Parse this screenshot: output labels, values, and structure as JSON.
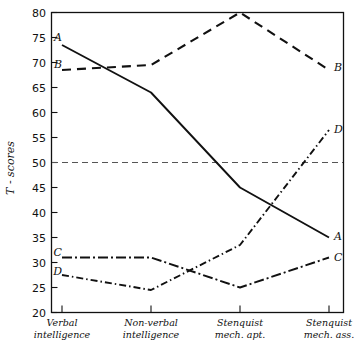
{
  "chart_data": {
    "type": "line",
    "title": "",
    "xlabel": "",
    "ylabel": "T - scores",
    "ylim": [
      20,
      80
    ],
    "xlim": [
      0,
      3
    ],
    "grid": false,
    "legend": "inline-end-labels",
    "categories": [
      "Verbal intelligence",
      "Non-verbal intelligence",
      "Stenquist mech. apt.",
      "Stenquist mech. ass."
    ],
    "category_lines": [
      [
        "Verbal",
        "intelligence"
      ],
      [
        "Non-verbal",
        "intelligence"
      ],
      [
        "Stenquist",
        "mech. apt."
      ],
      [
        "Stenquist",
        "mech. ass."
      ]
    ],
    "yticks": [
      20,
      25,
      30,
      35,
      40,
      45,
      50,
      55,
      60,
      65,
      70,
      75,
      80
    ],
    "ytick_labels": [
      "20",
      "25",
      "30",
      "35",
      "40",
      "45",
      "50",
      "55",
      "60",
      "65",
      "70",
      "75",
      "80"
    ],
    "reference_line": {
      "value": 50,
      "style": "dashed",
      "label": ""
    },
    "series": [
      {
        "name": "A",
        "label": "A",
        "style": "solid",
        "label_start": "A",
        "label_end": "A",
        "values": [
          73.5,
          64,
          45,
          35
        ]
      },
      {
        "name": "B",
        "label": "B",
        "style": "dashed",
        "label_start": "B",
        "label_end": "B",
        "values": [
          68.5,
          69.5,
          80,
          68.5
        ]
      },
      {
        "name": "C",
        "label": "C",
        "style": "dash-dot-dot",
        "label_start": "C",
        "label_end": "C",
        "values": [
          31,
          31,
          25,
          31
        ]
      },
      {
        "name": "D",
        "label": "D",
        "style": "dash-dot",
        "label_start": "D",
        "label_end": "D",
        "values": [
          27.5,
          24.5,
          33.5,
          56.5
        ]
      }
    ]
  }
}
